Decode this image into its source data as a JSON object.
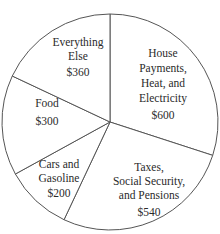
{
  "chart_data": {
    "type": "pie",
    "title": "",
    "categories": [
      "House Payments, Heat, and Electricity",
      "Taxes, Social Security, and Pensions",
      "Cars and Gasoline",
      "Food",
      "Everything Else"
    ],
    "values": [
      600,
      540,
      200,
      300,
      360
    ],
    "value_labels": [
      "$600",
      "$540",
      "$200",
      "$300",
      "$360"
    ],
    "total": 2000,
    "start_angle_deg": -90,
    "direction": "clockwise",
    "colors": {
      "fill": "#ffffff",
      "stroke": "#555555",
      "text": "#2a2a2a"
    },
    "slices": [
      {
        "lines": [
          "House",
          "Payments,",
          "Heat, and",
          "Electricity"
        ],
        "value": "$600"
      },
      {
        "lines": [
          "Taxes,",
          "Social Security,",
          "and Pensions"
        ],
        "value": "$540"
      },
      {
        "lines": [
          "Cars and",
          "Gasoline"
        ],
        "value": "$200"
      },
      {
        "lines": [
          "Food"
        ],
        "value": "$300"
      },
      {
        "lines": [
          "Everything",
          "Else"
        ],
        "value": "$360"
      }
    ]
  }
}
